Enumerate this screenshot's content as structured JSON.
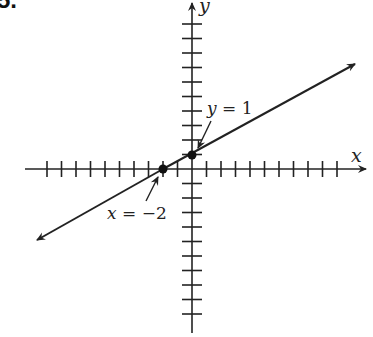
{
  "problem_number": "5.",
  "axes": {
    "x_label": "x",
    "y_label": "y",
    "origin_px": [
      192,
      169
    ],
    "unit_px": 14.5,
    "x_ticks_each_side": 10,
    "y_ticks_each_side": 10
  },
  "line": {
    "equation": "y = (1/2)x + 1",
    "slope": 0.5,
    "intercept": 1,
    "color": "#222222"
  },
  "points": [
    {
      "name": "x-intercept",
      "x": -2,
      "y": 0
    },
    {
      "name": "y-intercept",
      "x": 0,
      "y": 1
    }
  ],
  "annotations": {
    "y_intercept_label": {
      "var": "y",
      "rest": " = 1"
    },
    "x_intercept_label": {
      "var": "x",
      "rest": " = −2"
    }
  }
}
